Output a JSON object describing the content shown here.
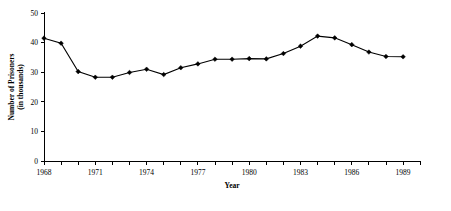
{
  "chart_data": {
    "type": "line",
    "title": "",
    "subtitle": "",
    "xlabel": "Year",
    "ylabel": "Number of Prisoners (in thousands)",
    "ylabel_line1": "Number of Prisoners",
    "ylabel_line2": "(in thousands)",
    "grid": false,
    "legend": "none",
    "xlim": [
      1968,
      1990
    ],
    "ylim": [
      0,
      50
    ],
    "yticks": [
      0,
      10,
      20,
      30,
      40,
      50
    ],
    "ytick_labels": [
      "0",
      "10",
      "20",
      "30",
      "40",
      "50"
    ],
    "xticks": [
      1968,
      1969,
      1970,
      1971,
      1972,
      1973,
      1974,
      1975,
      1976,
      1977,
      1978,
      1979,
      1980,
      1981,
      1982,
      1983,
      1984,
      1985,
      1986,
      1987,
      1988,
      1989,
      1990
    ],
    "xtick_labels_shown": [
      "1968",
      "1971",
      "1974",
      "1977",
      "1980",
      "1983",
      "1986",
      "1989"
    ],
    "xtick_label_years": [
      1968,
      1971,
      1974,
      1977,
      1980,
      1983,
      1986,
      1989
    ],
    "x": [
      1968,
      1969,
      1970,
      1971,
      1972,
      1973,
      1974,
      1975,
      1976,
      1977,
      1978,
      1979,
      1980,
      1981,
      1982,
      1983,
      1984,
      1985,
      1986,
      1987,
      1988,
      1989
    ],
    "values": [
      41.5,
      39.8,
      30.2,
      28.3,
      28.3,
      29.9,
      31.0,
      29.2,
      31.5,
      32.8,
      34.4,
      34.4,
      34.6,
      34.5,
      36.3,
      38.8,
      42.2,
      41.6,
      39.3,
      36.8,
      35.3,
      35.2
    ],
    "series": [
      {
        "name": "Number of Prisoners",
        "values": [
          41.5,
          39.8,
          30.2,
          28.3,
          28.3,
          29.9,
          31.0,
          29.2,
          31.5,
          32.8,
          34.4,
          34.4,
          34.6,
          34.5,
          36.3,
          38.8,
          42.2,
          41.6,
          39.3,
          36.8,
          35.3,
          35.2
        ]
      }
    ],
    "marker": "diamond",
    "line_color": "#000000",
    "marker_color": "#000000",
    "background_color": "#ffffff"
  }
}
